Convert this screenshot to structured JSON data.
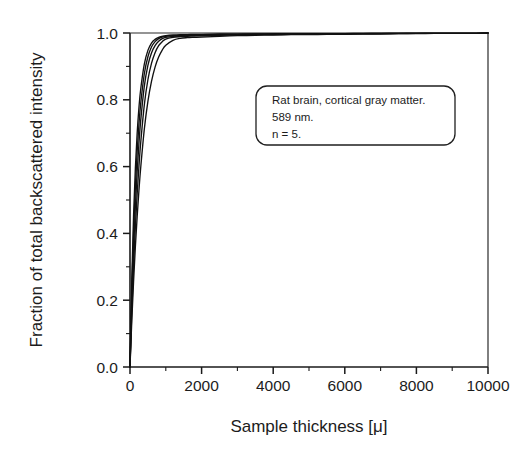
{
  "chart_data": {
    "type": "line",
    "title": "",
    "xlabel": "Sample thickness [μ]",
    "ylabel": "Fraction of total backscattered intensity",
    "xlim": [
      0,
      10000
    ],
    "ylim": [
      0.0,
      1.0
    ],
    "grid": false,
    "legend": "none",
    "x_tick_labels": [
      "0",
      "2000",
      "4000",
      "6000",
      "8000",
      "10000"
    ],
    "x_tick_values": [
      0,
      2000,
      4000,
      6000,
      8000,
      10000
    ],
    "x_minor_tick_values": [
      1000,
      3000,
      5000,
      7000,
      9000
    ],
    "y_tick_labels": [
      "0.0",
      "0.2",
      "0.4",
      "0.6",
      "0.8",
      "1.0"
    ],
    "y_tick_values": [
      0.0,
      0.2,
      0.4,
      0.6,
      0.8,
      1.0
    ],
    "y_minor_tick_values": [
      0.1,
      0.3,
      0.5,
      0.7,
      0.9
    ],
    "x": [
      0,
      50,
      100,
      150,
      200,
      250,
      300,
      400,
      500,
      600,
      700,
      800,
      900,
      1000,
      1200,
      1400,
      1600,
      1800,
      2000,
      2500,
      3000,
      3500,
      4000,
      4500,
      5000,
      5500,
      6000,
      6500,
      7000,
      7500,
      8000,
      8500,
      9000,
      9500,
      10000
    ],
    "series": [
      {
        "name": "sample-1",
        "values": [
          0.0,
          0.262,
          0.455,
          0.596,
          0.7,
          0.777,
          0.833,
          0.907,
          0.948,
          0.97,
          0.981,
          0.987,
          0.99,
          0.992,
          0.994,
          0.995,
          0.995,
          0.996,
          0.996,
          0.997,
          0.997,
          0.997,
          0.998,
          0.998,
          0.998,
          0.998,
          0.998,
          0.999,
          0.999,
          0.999,
          0.999,
          0.999,
          0.999,
          0.999,
          1.0
        ]
      },
      {
        "name": "sample-2",
        "values": [
          0.0,
          0.228,
          0.404,
          0.54,
          0.645,
          0.727,
          0.79,
          0.878,
          0.929,
          0.958,
          0.974,
          0.983,
          0.988,
          0.99,
          0.992,
          0.993,
          0.994,
          0.994,
          0.995,
          0.996,
          0.996,
          0.997,
          0.997,
          0.997,
          0.998,
          0.998,
          0.998,
          0.998,
          0.999,
          0.999,
          0.999,
          0.999,
          0.999,
          0.999,
          1.0
        ]
      },
      {
        "name": "sample-3",
        "values": [
          0.0,
          0.196,
          0.353,
          0.481,
          0.585,
          0.67,
          0.739,
          0.841,
          0.903,
          0.94,
          0.962,
          0.975,
          0.983,
          0.987,
          0.99,
          0.991,
          0.992,
          0.993,
          0.993,
          0.994,
          0.995,
          0.996,
          0.996,
          0.997,
          0.997,
          0.997,
          0.998,
          0.998,
          0.998,
          0.999,
          0.999,
          0.999,
          0.999,
          0.999,
          1.0
        ]
      },
      {
        "name": "sample-4",
        "values": [
          0.0,
          0.166,
          0.304,
          0.42,
          0.518,
          0.602,
          0.673,
          0.785,
          0.86,
          0.909,
          0.941,
          0.962,
          0.974,
          0.982,
          0.987,
          0.989,
          0.99,
          0.991,
          0.992,
          0.993,
          0.994,
          0.995,
          0.995,
          0.996,
          0.996,
          0.997,
          0.997,
          0.998,
          0.998,
          0.998,
          0.999,
          0.999,
          0.999,
          0.999,
          1.0
        ]
      },
      {
        "name": "sample-5",
        "values": [
          0.0,
          0.138,
          0.257,
          0.36,
          0.45,
          0.529,
          0.598,
          0.712,
          0.795,
          0.855,
          0.898,
          0.928,
          0.949,
          0.963,
          0.978,
          0.984,
          0.986,
          0.987,
          0.988,
          0.99,
          0.992,
          0.993,
          0.994,
          0.995,
          0.995,
          0.996,
          0.996,
          0.997,
          0.997,
          0.998,
          0.998,
          0.999,
          0.999,
          0.999,
          1.0
        ]
      }
    ],
    "annotation": {
      "lines": [
        "Rat brain, cortical gray matter.",
        "589 nm.",
        "n = 5."
      ]
    }
  },
  "colors": {
    "curve": "#111111",
    "axis": "#1a1a1a",
    "text": "#1c1c1c",
    "background": "#ffffff"
  }
}
